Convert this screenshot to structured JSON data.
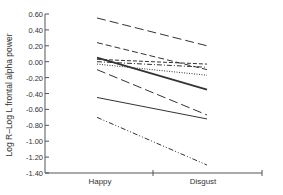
{
  "chart_data": {
    "type": "line",
    "title": "",
    "xlabel": "",
    "ylabel": "Log R–Log L frontal alpha power",
    "categories": [
      "Happy",
      "Disgust"
    ],
    "ylim": [
      -1.4,
      0.6
    ],
    "yticks": [
      "0.60",
      "0.40",
      "0.20",
      "0.00",
      "-0.20",
      "-0.40",
      "-0.60",
      "-0.80",
      "-1.00",
      "-1.20",
      "-1.40"
    ],
    "grid": false,
    "legend": "none",
    "series": [
      {
        "name": "subject-1",
        "style": "long-dash",
        "values": [
          0.55,
          0.2
        ]
      },
      {
        "name": "subject-2",
        "style": "dash",
        "values": [
          0.24,
          -0.1
        ]
      },
      {
        "name": "subject-3",
        "style": "solid-thick",
        "values": [
          0.05,
          -0.35
        ]
      },
      {
        "name": "subject-4",
        "style": "short-dash",
        "values": [
          0.03,
          -0.03
        ]
      },
      {
        "name": "subject-5",
        "style": "dash-dot",
        "values": [
          0.0,
          -0.07
        ]
      },
      {
        "name": "subject-6",
        "style": "dotted",
        "values": [
          -0.03,
          -0.17
        ]
      },
      {
        "name": "subject-7",
        "style": "long-dash",
        "values": [
          -0.1,
          -0.67
        ]
      },
      {
        "name": "subject-8",
        "style": "solid",
        "values": [
          -0.45,
          -0.72
        ]
      },
      {
        "name": "subject-9",
        "style": "dash-dot-dot",
        "values": [
          -0.7,
          -1.3
        ]
      }
    ]
  },
  "colors": {
    "axis": "#555555",
    "line": "#333333"
  }
}
